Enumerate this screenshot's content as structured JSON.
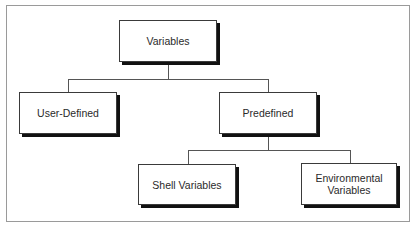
{
  "diagram": {
    "type": "tree",
    "root": {
      "label": "Variables",
      "children": [
        {
          "label": "User-Defined",
          "children": []
        },
        {
          "label": "Predefined",
          "children": [
            {
              "label": "Shell Variables",
              "children": []
            },
            {
              "label": "Environmental\nVariables",
              "children": []
            }
          ]
        }
      ]
    }
  },
  "nodes": {
    "variables": "Variables",
    "user_defined": "User-Defined",
    "predefined": "Predefined",
    "shell_variables": "Shell Variables",
    "environmental_variables": "Environmental\nVariables"
  },
  "colors": {
    "border": "#3a3a3a",
    "shadow": "#111111",
    "connector": "#555555",
    "frame": "#9a9a9a",
    "text": "#2a2a2a"
  }
}
